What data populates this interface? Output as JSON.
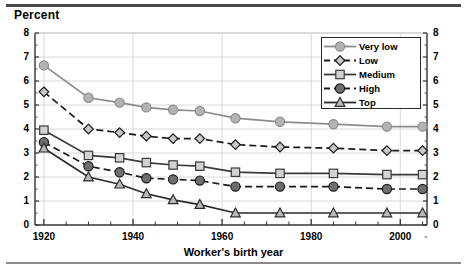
{
  "chart_data": {
    "type": "line",
    "title": "",
    "ylabel": "Percent",
    "xlabel": "Worker's birth year",
    "ylim": [
      0,
      8
    ],
    "xlim": [
      1918,
      2006
    ],
    "yticks": [
      0,
      1,
      2,
      3,
      4,
      5,
      6,
      7,
      8
    ],
    "ytick_labels": [
      "0",
      "1",
      "2",
      "3",
      "4",
      "5",
      "6",
      "7",
      "8"
    ],
    "right_axis": true,
    "right_ytick_labels": [
      "0",
      "1",
      "2",
      "3",
      "4",
      "5",
      "6",
      "7",
      "8"
    ],
    "xticks": [
      1920,
      1940,
      1960,
      1980,
      2000
    ],
    "xtick_labels": [
      "1920",
      "1940",
      "1960",
      "1980",
      "2000"
    ],
    "grid": true,
    "legend_position": "top-right",
    "x": [
      1920,
      1930,
      1937,
      1943,
      1949,
      1955,
      1963,
      1973,
      1985,
      1997,
      2005
    ],
    "series": [
      {
        "name": "Very low",
        "marker": "circle",
        "line": "solid",
        "color": "#8c8c8c",
        "fill": "#b3b3b3",
        "values": [
          6.65,
          5.3,
          5.1,
          4.9,
          4.8,
          4.75,
          4.45,
          4.3,
          4.2,
          4.1,
          4.1
        ]
      },
      {
        "name": "Low",
        "marker": "diamond",
        "line": "dashed",
        "color": "#1a1a1a",
        "fill": "#c8c8c8",
        "values": [
          5.55,
          4.0,
          3.85,
          3.7,
          3.6,
          3.6,
          3.35,
          3.25,
          3.2,
          3.1,
          3.1
        ]
      },
      {
        "name": "Medium",
        "marker": "square",
        "line": "solid",
        "color": "#3a3a3a",
        "fill": "#d2d2d2",
        "values": [
          3.95,
          2.9,
          2.8,
          2.6,
          2.5,
          2.45,
          2.2,
          2.15,
          2.15,
          2.1,
          2.1
        ]
      },
      {
        "name": "High",
        "marker": "circle",
        "line": "dashed",
        "color": "#1a1a1a",
        "fill": "#6e6e6e",
        "values": [
          3.45,
          2.45,
          2.2,
          1.95,
          1.9,
          1.85,
          1.6,
          1.6,
          1.6,
          1.5,
          1.5
        ]
      },
      {
        "name": "Top",
        "marker": "triangle",
        "line": "solid",
        "color": "#2b2b2b",
        "fill": "#b9b9b9",
        "values": [
          3.2,
          2.0,
          1.7,
          1.3,
          1.05,
          0.85,
          0.5,
          0.5,
          0.5,
          0.5,
          0.5
        ]
      }
    ]
  }
}
